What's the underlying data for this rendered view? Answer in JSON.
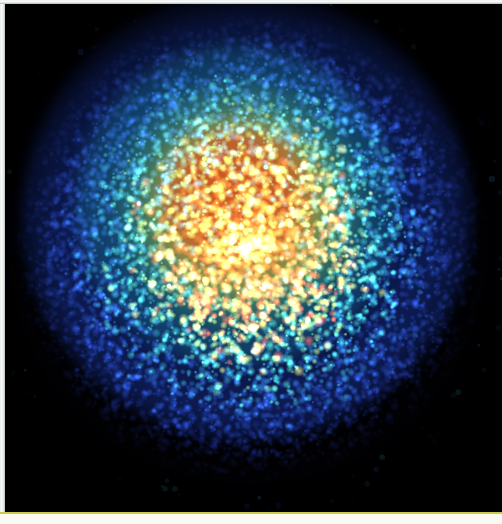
{
  "figure": {
    "kind": "false-color-density-image",
    "background_color": "#020205",
    "plate": {
      "left": 5,
      "top": 4,
      "width": 497,
      "height": 508
    },
    "borders": {
      "left_edge_color": "#fdfdfb",
      "top_edge_color": "#fbfcfa",
      "bottom_band_color": "#fbfaf2",
      "bottom_rule_color": "#c9c94a"
    }
  },
  "chart_data": {
    "type": "heatmap",
    "title": "",
    "subtitle": "",
    "xlabel": "",
    "ylabel": "",
    "legend": [],
    "annotations": [],
    "grid": false,
    "axis_visible": false,
    "tick_labels": {
      "x": [],
      "y": []
    },
    "xlim": [
      0,
      497
    ],
    "ylim": [
      0,
      508
    ],
    "center": {
      "x": 245,
      "y": 240
    },
    "colormap": {
      "name": "jet-like",
      "stops": [
        {
          "position": 0.0,
          "color": "#020205",
          "label": "background"
        },
        {
          "position": 0.14,
          "color": "#1A2E9E",
          "label": "very low"
        },
        {
          "position": 0.3,
          "color": "#2348D6",
          "label": "low"
        },
        {
          "position": 0.44,
          "color": "#2E9AC8",
          "label": "low-mid"
        },
        {
          "position": 0.56,
          "color": "#35C8CE",
          "label": "mid"
        },
        {
          "position": 0.68,
          "color": "#5FC47E",
          "label": "mid-high"
        },
        {
          "position": 0.78,
          "color": "#A8D24E",
          "label": "high"
        },
        {
          "position": 0.88,
          "color": "#F0E258",
          "label": "very high"
        },
        {
          "position": 1.0,
          "color": "#E04A1C",
          "label": "peak"
        }
      ]
    },
    "radial_profile": {
      "units": "pixels from center",
      "radii": [
        0,
        25,
        50,
        75,
        100,
        125,
        150,
        175,
        200,
        225,
        240
      ],
      "intensity": [
        1.0,
        0.97,
        0.9,
        0.78,
        0.62,
        0.47,
        0.34,
        0.23,
        0.13,
        0.05,
        0.0
      ],
      "dominant_color": [
        "#E04A1C",
        "#E04A1C",
        "#E85A22",
        "#F0E258",
        "#A8D24E",
        "#5FC47E",
        "#35C8CE",
        "#2E7ACC",
        "#2348D6",
        "#16287A",
        "#020205"
      ]
    },
    "rings": [
      {
        "name": "core-red",
        "inner_radius": 0,
        "outer_radius": 70,
        "color": "#E04A1C",
        "speckle_color": "#F0E258"
      },
      {
        "name": "yellow-ring",
        "inner_radius": 60,
        "outer_radius": 95,
        "color": "#F0E258",
        "speckle_color": "#E8EE8A"
      },
      {
        "name": "green-ring",
        "inner_radius": 85,
        "outer_radius": 125,
        "color": "#7FC85C",
        "speckle_color": "#BEE06A"
      },
      {
        "name": "cyan-ring",
        "inner_radius": 115,
        "outer_radius": 160,
        "color": "#35C8CE",
        "speckle_color": "#8FEAEC"
      },
      {
        "name": "blue-halo",
        "inner_radius": 150,
        "outer_radius": 225,
        "color": "#2348D6",
        "speckle_color": "#4FA8E8"
      },
      {
        "name": "sparse-fringe",
        "inner_radius": 215,
        "outer_radius": 250,
        "color": "#16287A",
        "speckle_color": "#6FC8E8"
      }
    ],
    "point_count_estimate": 9000
  }
}
